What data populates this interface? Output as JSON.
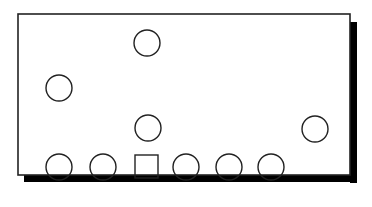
{
  "diagram": {
    "colors": {
      "stroke": "#222222",
      "shadow": "#000000",
      "fill": "#ffffff"
    },
    "frame": {
      "x": 18,
      "y": 14,
      "width": 332,
      "height": 161
    },
    "shapes": [
      {
        "type": "circle",
        "cx": 147,
        "cy": 43,
        "r": 13
      },
      {
        "type": "circle",
        "cx": 59,
        "cy": 88,
        "r": 13
      },
      {
        "type": "circle",
        "cx": 148,
        "cy": 128,
        "r": 13
      },
      {
        "type": "circle",
        "cx": 315,
        "cy": 129,
        "r": 13
      },
      {
        "type": "circle",
        "cx": 59,
        "cy": 167,
        "r": 13
      },
      {
        "type": "circle",
        "cx": 103,
        "cy": 167,
        "r": 13
      },
      {
        "type": "square",
        "x": 135,
        "y": 155,
        "size": 23
      },
      {
        "type": "circle",
        "cx": 186,
        "cy": 167,
        "r": 13
      },
      {
        "type": "circle",
        "cx": 229,
        "cy": 167,
        "r": 13
      },
      {
        "type": "circle",
        "cx": 271,
        "cy": 167,
        "r": 13
      }
    ]
  }
}
